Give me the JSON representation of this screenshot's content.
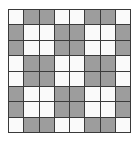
{
  "figure": {
    "type": "pattern-grid",
    "rows": 8,
    "columns": 8,
    "cell_count": 64,
    "background_color": "#ffffff",
    "light_cell_color": "#fafafa",
    "dark_cell_color": "#9d9d9d",
    "grid_line_color": "#3a3a3a",
    "grid_line_width_px": 1,
    "border_color": "#3a3a3a",
    "grid_left_px": 8,
    "grid_top_px": 9,
    "grid_width_px": 123,
    "grid_height_px": 124,
    "cell_width_px": 15.4,
    "cell_height_px": 15.5,
    "pattern_description": "2x2 blocks of shaded cells arranged in an offset checkerboard; first and last rows are single-height bands",
    "shaded_cell_total": 32,
    "light_cell_total": 32
  },
  "grid": {
    "cells": [
      [
        "light",
        "dark",
        "dark",
        "light",
        "light",
        "dark",
        "dark",
        "light"
      ],
      [
        "dark",
        "light",
        "light",
        "dark",
        "dark",
        "light",
        "light",
        "dark"
      ],
      [
        "dark",
        "light",
        "light",
        "dark",
        "dark",
        "light",
        "light",
        "dark"
      ],
      [
        "light",
        "dark",
        "dark",
        "light",
        "light",
        "dark",
        "dark",
        "light"
      ],
      [
        "light",
        "dark",
        "dark",
        "light",
        "light",
        "dark",
        "dark",
        "light"
      ],
      [
        "dark",
        "light",
        "light",
        "dark",
        "dark",
        "light",
        "light",
        "dark"
      ],
      [
        "dark",
        "light",
        "light",
        "dark",
        "dark",
        "light",
        "light",
        "dark"
      ],
      [
        "light",
        "dark",
        "dark",
        "light",
        "light",
        "dark",
        "dark",
        "light"
      ]
    ],
    "row_labels": [
      "row-1",
      "row-2",
      "row-3",
      "row-4",
      "row-5",
      "row-6",
      "row-7",
      "row-8"
    ],
    "column_labels": [
      "col-1",
      "col-2",
      "col-3",
      "col-4",
      "col-5",
      "col-6",
      "col-7",
      "col-8"
    ]
  }
}
